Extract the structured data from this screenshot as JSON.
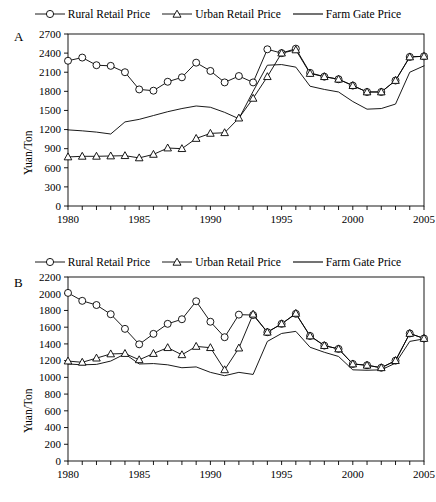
{
  "figure": {
    "panels": [
      {
        "letter": "A",
        "ylabel": "Yuan/Ton",
        "legend": [
          {
            "label": "Rural Retail Price",
            "marker": "circle"
          },
          {
            "label": "Urban Retail Price",
            "marker": "triangle"
          },
          {
            "label": "Farm Gate Price",
            "marker": "none"
          }
        ]
      },
      {
        "letter": "B",
        "ylabel": "Yuan/Ton",
        "legend": [
          {
            "label": "Rural Retail Price",
            "marker": "circle"
          },
          {
            "label": "Urban Retail Price",
            "marker": "triangle"
          },
          {
            "label": "Farm Gate Price",
            "marker": "none"
          }
        ]
      }
    ]
  },
  "chart_data": [
    {
      "type": "line",
      "panel": "A",
      "title": "",
      "xlabel": "",
      "ylabel": "Yuan/Ton",
      "xlim": [
        1980,
        2005
      ],
      "ylim": [
        0,
        2700
      ],
      "yticks": [
        0,
        300,
        600,
        900,
        1200,
        1500,
        1800,
        2100,
        2400,
        2700
      ],
      "xticks": [
        1980,
        1985,
        1990,
        1995,
        2000,
        2005
      ],
      "xtick_interval": 1,
      "grid": false,
      "legend_position": "top-center",
      "x": [
        1980,
        1981,
        1982,
        1983,
        1984,
        1985,
        1986,
        1987,
        1988,
        1989,
        1990,
        1991,
        1992,
        1993,
        1994,
        1995,
        1996,
        1997,
        1998,
        1999,
        2000,
        2001,
        2002,
        2003,
        2004,
        2005
      ],
      "series": [
        {
          "name": "Rural Retail Price",
          "marker": "circle",
          "values": [
            2280,
            2330,
            2210,
            2200,
            2100,
            1830,
            1810,
            1950,
            2020,
            2250,
            2120,
            1940,
            2040,
            1940,
            2460,
            2400,
            2470,
            2090,
            2030,
            1990,
            1890,
            1790,
            1790,
            1970,
            2340,
            2350
          ]
        },
        {
          "name": "Urban Retail Price",
          "marker": "triangle",
          "values": [
            770,
            780,
            780,
            785,
            790,
            755,
            810,
            910,
            900,
            1060,
            1140,
            1150,
            1380,
            1690,
            2030,
            2400,
            2450,
            2080,
            2030,
            1990,
            1890,
            1790,
            1790,
            1970,
            2340,
            2350
          ]
        },
        {
          "name": "Farm Gate Price",
          "marker": "none",
          "values": [
            1195,
            1180,
            1160,
            1130,
            1320,
            1360,
            1420,
            1480,
            1530,
            1570,
            1550,
            1470,
            1370,
            1800,
            2210,
            2220,
            2180,
            1880,
            1830,
            1790,
            1640,
            1520,
            1530,
            1600,
            2100,
            2200
          ]
        }
      ]
    },
    {
      "type": "line",
      "panel": "B",
      "title": "",
      "xlabel": "",
      "ylabel": "Yuan/Ton",
      "xlim": [
        1980,
        2005
      ],
      "ylim": [
        0,
        2200
      ],
      "yticks": [
        0,
        200,
        400,
        600,
        800,
        1000,
        1200,
        1400,
        1600,
        1800,
        2000,
        2200
      ],
      "xticks": [
        1980,
        1985,
        1990,
        1995,
        2000,
        2005
      ],
      "xtick_interval": 1,
      "grid": false,
      "legend_position": "top-center",
      "x": [
        1980,
        1981,
        1982,
        1983,
        1984,
        1985,
        1986,
        1987,
        1988,
        1989,
        1990,
        1991,
        1992,
        1993,
        1994,
        1995,
        1996,
        1997,
        1998,
        1999,
        2000,
        2001,
        2002,
        2003,
        2004,
        2005
      ],
      "series": [
        {
          "name": "Rural Retail Price",
          "marker": "circle",
          "values": [
            2010,
            1915,
            1865,
            1755,
            1580,
            1395,
            1520,
            1640,
            1695,
            1910,
            1665,
            1480,
            1750,
            1745,
            1540,
            1640,
            1760,
            1495,
            1380,
            1340,
            1160,
            1145,
            1115,
            1200,
            1525,
            1465
          ]
        },
        {
          "name": "Urban Retail Price",
          "marker": "triangle",
          "values": [
            1195,
            1180,
            1230,
            1280,
            1285,
            1210,
            1285,
            1355,
            1270,
            1370,
            1355,
            1090,
            1350,
            1755,
            1540,
            1640,
            1765,
            1495,
            1380,
            1340,
            1160,
            1145,
            1115,
            1200,
            1525,
            1465
          ]
        },
        {
          "name": "Farm Gate Price",
          "marker": "none",
          "values": [
            1160,
            1150,
            1155,
            1195,
            1280,
            1160,
            1165,
            1150,
            1115,
            1125,
            1060,
            1020,
            1060,
            1035,
            1430,
            1525,
            1550,
            1360,
            1300,
            1250,
            1090,
            1085,
            1090,
            1170,
            1430,
            1460
          ]
        }
      ]
    }
  ]
}
